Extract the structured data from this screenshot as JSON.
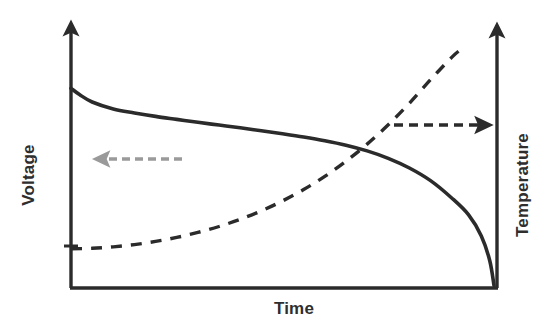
{
  "figure": {
    "background_color": "#ffffff",
    "axis_color": "#2b2b2b",
    "voltage_curve_color": "#2b2b2b",
    "temperature_curve_color": "#2b2b2b",
    "left_annotation_color": "#9a9a9a",
    "right_annotation_color": "#2b2b2b"
  },
  "labels": {
    "left_axis": "Voltage",
    "right_axis": "Temperature",
    "bottom_axis": "Time"
  },
  "annotations": {
    "left_arrow": {
      "name": "voltage-points-to-left-axis",
      "direction": "left",
      "style": "dashed",
      "color": "#9a9a9a"
    },
    "right_arrow": {
      "name": "temperature-points-to-right-axis",
      "direction": "right",
      "style": "dashed",
      "color": "#2b2b2b"
    }
  },
  "chart_data": {
    "type": "line",
    "title": "",
    "xlabel": "Time",
    "ylabel": "Voltage",
    "y2label": "Temperature",
    "grid": false,
    "legend": "none",
    "xlim": [
      0,
      1
    ],
    "ylim": [
      0,
      1
    ],
    "y2lim": [
      0,
      1
    ],
    "axis_ticks": "none",
    "series": [
      {
        "name": "Voltage",
        "axis": "left",
        "style": "solid",
        "color": "#2b2b2b",
        "description": "Starts high, decays slowly and nearly linearly, then falls off sharply to zero at the end of discharge",
        "x": [
          0.0,
          0.02,
          0.05,
          0.1,
          0.15,
          0.2,
          0.25,
          0.3,
          0.35,
          0.4,
          0.45,
          0.5,
          0.55,
          0.6,
          0.65,
          0.7,
          0.75,
          0.8,
          0.85,
          0.9,
          0.94,
          0.97,
          0.99,
          1.0
        ],
        "y": [
          0.805,
          0.78,
          0.75,
          0.722,
          0.706,
          0.692,
          0.68,
          0.668,
          0.657,
          0.646,
          0.634,
          0.622,
          0.609,
          0.594,
          0.576,
          0.553,
          0.523,
          0.484,
          0.433,
          0.363,
          0.295,
          0.21,
          0.11,
          0.01
        ]
      },
      {
        "name": "Temperature",
        "axis": "right",
        "style": "dashed",
        "color": "#2b2b2b",
        "description": "Starts low and flat, then rises with increasing slope, climbing steeply near the end of discharge",
        "x": [
          0.0,
          0.05,
          0.1,
          0.15,
          0.2,
          0.25,
          0.3,
          0.35,
          0.4,
          0.45,
          0.5,
          0.55,
          0.6,
          0.65,
          0.7,
          0.75,
          0.8,
          0.85,
          0.9,
          0.92
        ],
        "y": [
          0.158,
          0.16,
          0.166,
          0.175,
          0.188,
          0.204,
          0.224,
          0.248,
          0.277,
          0.311,
          0.351,
          0.397,
          0.45,
          0.511,
          0.58,
          0.658,
          0.745,
          0.84,
          0.93,
          0.96
        ]
      }
    ]
  }
}
